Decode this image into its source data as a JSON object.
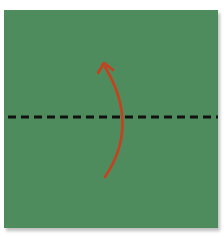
{
  "diagram": {
    "type": "origami-fold-step",
    "paper": {
      "color": "#4e8c5d",
      "shape": "square"
    },
    "fold_line": {
      "style": "dashed",
      "color": "#111111",
      "orientation": "horizontal",
      "label": "valley-fold-line"
    },
    "arrow": {
      "color": "#c8401e",
      "direction": "up",
      "label": "fold-bottom-up"
    }
  }
}
